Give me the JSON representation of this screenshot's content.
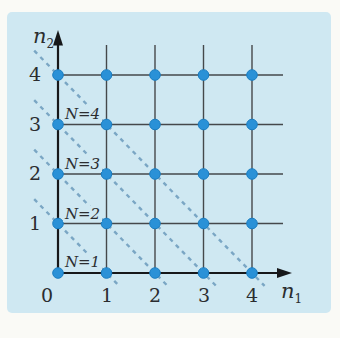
{
  "figure": {
    "type": "lattice-state-plot"
  },
  "colors": {
    "page_bg": "#fafaf6",
    "panel_bg": "#cfe8f2",
    "grid_line": "#45484b",
    "axis": "#17181a",
    "dot_fill": "#2a91d7",
    "dot_edge": "#1b7ec2",
    "dashed_line": "#7aa6c4",
    "text": "#2b2d30"
  },
  "axes": {
    "x": {
      "label_base": "n",
      "label_sub": "1",
      "ticks": [
        "0",
        "1",
        "2",
        "3",
        "4"
      ]
    },
    "y": {
      "label_base": "n",
      "label_sub": "2",
      "ticks": [
        "4",
        "3",
        "2",
        "1"
      ]
    }
  },
  "diagonal_lines": [
    {
      "label": "N=4",
      "value": 4
    },
    {
      "label": "N=3",
      "value": 3
    },
    {
      "label": "N=2",
      "value": 2
    },
    {
      "label": "N=1",
      "value": 1
    }
  ],
  "chart_data": {
    "type": "scatter",
    "title": "",
    "xlabel": "n1",
    "ylabel": "n2",
    "xlim": [
      0,
      4
    ],
    "ylim": [
      0,
      4
    ],
    "x_ticks": [
      0,
      1,
      2,
      3,
      4
    ],
    "y_ticks": [
      1,
      2,
      3,
      4
    ],
    "grid": true,
    "points": [
      [
        0,
        0
      ],
      [
        1,
        0
      ],
      [
        2,
        0
      ],
      [
        3,
        0
      ],
      [
        4,
        0
      ],
      [
        0,
        1
      ],
      [
        1,
        1
      ],
      [
        2,
        1
      ],
      [
        3,
        1
      ],
      [
        4,
        1
      ],
      [
        0,
        2
      ],
      [
        1,
        2
      ],
      [
        2,
        2
      ],
      [
        3,
        2
      ],
      [
        4,
        2
      ],
      [
        0,
        3
      ],
      [
        1,
        3
      ],
      [
        2,
        3
      ],
      [
        3,
        3
      ],
      [
        4,
        3
      ],
      [
        0,
        4
      ],
      [
        1,
        4
      ],
      [
        2,
        4
      ],
      [
        3,
        4
      ],
      [
        4,
        4
      ]
    ],
    "diagonals": [
      {
        "label": "N=1",
        "line_through": [
          [
            0,
            1
          ],
          [
            1,
            0
          ]
        ],
        "style": "dashed"
      },
      {
        "label": "N=2",
        "line_through": [
          [
            0,
            2
          ],
          [
            2,
            0
          ]
        ],
        "style": "dashed"
      },
      {
        "label": "N=3",
        "line_through": [
          [
            0,
            3
          ],
          [
            3,
            0
          ]
        ],
        "style": "dashed"
      },
      {
        "label": "N=4",
        "line_through": [
          [
            0,
            4
          ],
          [
            4,
            0
          ]
        ],
        "style": "dashed"
      }
    ]
  }
}
